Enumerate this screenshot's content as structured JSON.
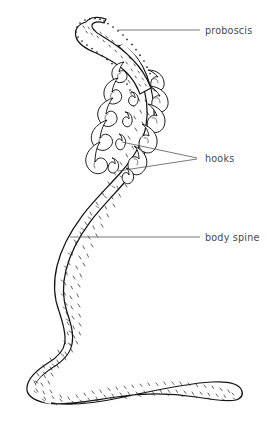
{
  "figure": {
    "organism": "acanthocephalan",
    "background_color": "#ffffff",
    "ink_color": "#151515",
    "label_color": "#4a4a4a",
    "leader_color": "#55555a",
    "width": 276,
    "height": 422
  },
  "labels": [
    {
      "id": "proboscis",
      "text": "proboscis",
      "text_x": 205,
      "text_y": 36,
      "leader": [
        [
          118,
          30
        ],
        [
          200,
          30
        ]
      ],
      "target": "anterior retractable proboscis"
    },
    {
      "id": "hooks",
      "text": "hooks",
      "text_x": 205,
      "text_y": 163,
      "leader_upper": [
        [
          122,
          142
        ],
        [
          197,
          158
        ]
      ],
      "leader_lower": [
        [
          118,
          170
        ],
        [
          197,
          159
        ]
      ],
      "target": "recurved proboscis hooks"
    },
    {
      "id": "body-spine",
      "text": "body spine",
      "text_x": 205,
      "text_y": 241,
      "leader": [
        [
          70,
          237
        ],
        [
          200,
          237
        ]
      ],
      "target": "cuticular body spines on trunk"
    }
  ],
  "anatomy": {
    "parts": [
      "proboscis",
      "hooks",
      "body spine",
      "trunk",
      "tail"
    ]
  }
}
